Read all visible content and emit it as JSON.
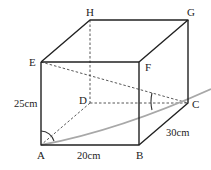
{
  "diagram": {
    "type": "rectangular prism (cuboid)",
    "vertices": {
      "A": {
        "label": "A"
      },
      "B": {
        "label": "B"
      },
      "C": {
        "label": "C"
      },
      "D": {
        "label": "D"
      },
      "E": {
        "label": "E"
      },
      "F": {
        "label": "F"
      },
      "G": {
        "label": "G"
      },
      "H": {
        "label": "H"
      }
    },
    "dimensions": {
      "height": "25cm",
      "width": "20cm",
      "depth": "30cm"
    },
    "solid_edges": [
      "AB",
      "BF",
      "FE",
      "EA",
      "EH",
      "HG",
      "GF",
      "GC",
      "CB"
    ],
    "hidden_edges": [
      "HD",
      "DA",
      "DC"
    ],
    "diagonals_dashed": [
      "EC"
    ],
    "highlighted_line": "AC (extended, gray)",
    "angles_marked": [
      "EAC at A",
      "ECA at C"
    ],
    "colors": {
      "edge": "#222222",
      "highlight": "#a8a8a8"
    }
  }
}
